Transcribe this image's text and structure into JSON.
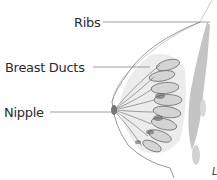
{
  "diagram": {
    "labels": {
      "ribs": "Ribs",
      "breast_ducts": "Breast Ducts",
      "nipple": "Nipple",
      "partial_corner": "L"
    },
    "colors": {
      "label_text": "#2b2b2b",
      "leader_line": "#888888",
      "outline": "#9a9a9a",
      "duct_shading": "#6e6e6e",
      "rib_shading": "#a8a8a8",
      "background": "#ffffff"
    }
  }
}
